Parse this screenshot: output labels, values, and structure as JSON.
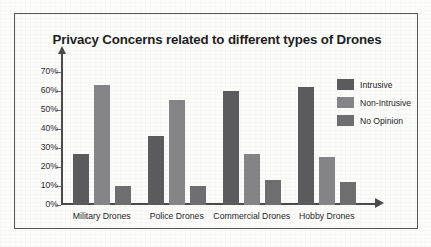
{
  "chart_data": {
    "type": "bar",
    "title": "Privacy Concerns related to different types of Drones",
    "xlabel": "",
    "ylabel": "",
    "categories": [
      "Military Drones",
      "Police Drones",
      "Commercial Drones",
      "Hobby Drones"
    ],
    "series": [
      {
        "name": "Intrusive",
        "values": [
          27,
          36,
          60,
          62
        ],
        "color": "#5a5a5c"
      },
      {
        "name": "Non-Intrusive",
        "values": [
          63,
          55,
          27,
          25
        ],
        "color": "#858587"
      },
      {
        "name": "No Opinion",
        "values": [
          10,
          10,
          13,
          12
        ],
        "color": "#6e6e70"
      }
    ],
    "ylim": [
      0,
      75
    ],
    "y_ticks": [
      0,
      10,
      20,
      30,
      40,
      50,
      60,
      70
    ],
    "y_tick_labels": [
      "0%",
      "10%",
      "20%",
      "30%",
      "40%",
      "50%",
      "60%",
      "70%"
    ],
    "grid": false,
    "legend_position": "top-right",
    "axis_arrows": true
  },
  "figure": {
    "border_color": "#555557",
    "background_color": "#fcfcfb",
    "axis_color": "#4a4a4c",
    "text_color": "#1d1d1f"
  }
}
